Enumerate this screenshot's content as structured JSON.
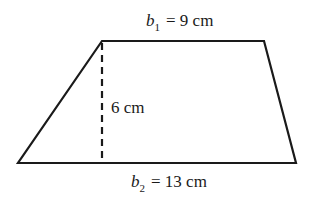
{
  "diagram": {
    "type": "trapezoid",
    "stroke_color": "#1a1a1a",
    "top_base": {
      "var": "b",
      "sub": "1",
      "value": "= 9 cm"
    },
    "bottom_base": {
      "var": "b",
      "sub": "2",
      "value": "= 13 cm"
    },
    "height": {
      "label": "6 cm"
    }
  }
}
